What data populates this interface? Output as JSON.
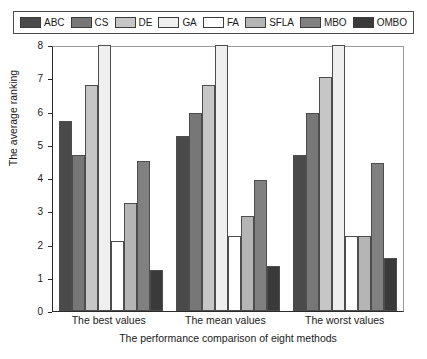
{
  "legend": {
    "items": [
      {
        "label": "ABC",
        "color": "#4a4a4a"
      },
      {
        "label": "CS",
        "color": "#777777"
      },
      {
        "label": "DE",
        "color": "#c6c6c6"
      },
      {
        "label": "GA",
        "color": "#efefef"
      },
      {
        "label": "FA",
        "color": "#ffffff"
      },
      {
        "label": "SFLA",
        "color": "#b5b5b5"
      },
      {
        "label": "MBO",
        "color": "#808080"
      },
      {
        "label": "OMBO",
        "color": "#3a3a3a"
      }
    ]
  },
  "axes": {
    "y_ticks": [
      "0",
      "1",
      "2",
      "3",
      "4",
      "5",
      "6",
      "7",
      "8"
    ],
    "y_title": "The average ranking",
    "x_title": "The performance comparison of eight methods"
  },
  "chart_data": {
    "type": "bar",
    "title": "",
    "xlabel": "The performance comparison of eight methods",
    "ylabel": "The average ranking",
    "ylim": [
      0,
      8
    ],
    "grid": false,
    "legend_position": "top",
    "categories": [
      "The best values",
      "The mean values",
      "The worst values"
    ],
    "series": [
      {
        "name": "ABC",
        "color": "#4a4a4a",
        "values": [
          5.7,
          5.25,
          4.7
        ]
      },
      {
        "name": "CS",
        "color": "#777777",
        "values": [
          4.7,
          5.95,
          5.95
        ]
      },
      {
        "name": "DE",
        "color": "#c6c6c6",
        "values": [
          6.8,
          6.8,
          7.05
        ]
      },
      {
        "name": "GA",
        "color": "#efefef",
        "values": [
          8.0,
          8.0,
          8.0
        ]
      },
      {
        "name": "FA",
        "color": "#ffffff",
        "values": [
          2.12,
          2.25,
          2.25
        ]
      },
      {
        "name": "SFLA",
        "color": "#b5b5b5",
        "values": [
          3.25,
          2.87,
          2.25
        ]
      },
      {
        "name": "MBO",
        "color": "#808080",
        "values": [
          4.5,
          3.95,
          4.45
        ]
      },
      {
        "name": "OMBO",
        "color": "#3a3a3a",
        "values": [
          1.22,
          1.35,
          1.6
        ]
      }
    ]
  }
}
